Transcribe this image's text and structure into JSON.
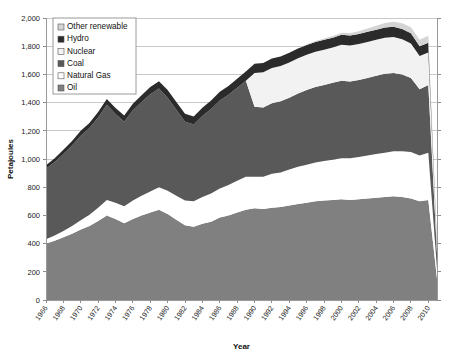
{
  "chart_data": {
    "type": "area",
    "title": "",
    "xlabel": "Year",
    "ylabel": "Petajoules",
    "stacked": true,
    "grid": true,
    "legend_position": "top-left",
    "xlim": [
      1966,
      2011
    ],
    "ylim": [
      0,
      2000
    ],
    "ytick_step": 200,
    "ytick_labels": [
      "0",
      "200",
      "400",
      "600",
      "800",
      "1,000",
      "1,200",
      "1,400",
      "1,600",
      "1,800",
      "2,000"
    ],
    "xtick_labels": [
      "1966",
      "1968",
      "1970",
      "1972",
      "1974",
      "1976",
      "1978",
      "1980",
      "1982",
      "1984",
      "1986",
      "1988",
      "1990",
      "1992",
      "1994",
      "1996",
      "1998",
      "2000",
      "2002",
      "2004",
      "2006",
      "2008",
      "2010"
    ],
    "x": [
      1966,
      1967,
      1968,
      1969,
      1970,
      1971,
      1972,
      1973,
      1974,
      1975,
      1976,
      1977,
      1978,
      1979,
      1980,
      1981,
      1982,
      1983,
      1984,
      1985,
      1986,
      1987,
      1988,
      1989,
      1990,
      1991,
      1992,
      1993,
      1994,
      1995,
      1996,
      1997,
      1998,
      1999,
      2000,
      2001,
      2002,
      2003,
      2004,
      2005,
      2006,
      2007,
      2008,
      2009,
      2010,
      2011
    ],
    "series": [
      {
        "name": "Oil",
        "color": "#808080",
        "values": [
          400,
          420,
          445,
          470,
          500,
          525,
          560,
          600,
          575,
          545,
          575,
          600,
          620,
          640,
          610,
          570,
          530,
          520,
          540,
          555,
          585,
          600,
          620,
          640,
          650,
          645,
          655,
          660,
          670,
          680,
          690,
          700,
          705,
          710,
          715,
          710,
          715,
          720,
          725,
          730,
          735,
          730,
          720,
          700,
          710,
          150
        ]
      },
      {
        "name": "Natural Gas",
        "color": "#ffffff",
        "values": [
          30,
          38,
          45,
          55,
          65,
          80,
          95,
          110,
          115,
          120,
          130,
          140,
          150,
          160,
          165,
          170,
          175,
          180,
          190,
          200,
          205,
          215,
          225,
          235,
          225,
          230,
          240,
          245,
          255,
          265,
          270,
          275,
          280,
          285,
          290,
          295,
          300,
          305,
          310,
          315,
          320,
          325,
          330,
          325,
          335,
          70
        ]
      },
      {
        "name": "Coal",
        "color": "#595959",
        "values": [
          500,
          520,
          545,
          570,
          600,
          615,
          640,
          675,
          630,
          600,
          640,
          665,
          690,
          700,
          660,
          610,
          560,
          545,
          575,
          600,
          625,
          640,
          660,
          680,
          495,
          490,
          500,
          505,
          510,
          520,
          530,
          535,
          540,
          545,
          550,
          545,
          545,
          550,
          555,
          560,
          555,
          545,
          525,
          470,
          480,
          110
        ]
      },
      {
        "name": "Nuclear",
        "color": "#f2f2f2",
        "values": [
          0,
          0,
          0,
          0,
          0,
          0,
          0,
          0,
          0,
          0,
          0,
          0,
          0,
          0,
          0,
          0,
          0,
          0,
          0,
          0,
          0,
          0,
          0,
          0,
          240,
          250,
          250,
          250,
          250,
          250,
          250,
          250,
          250,
          250,
          255,
          255,
          255,
          255,
          255,
          255,
          255,
          250,
          245,
          235,
          230,
          50
        ]
      },
      {
        "name": "Hydro",
        "color": "#2b2b2b",
        "values": [
          25,
          28,
          30,
          32,
          35,
          36,
          38,
          40,
          42,
          44,
          46,
          48,
          50,
          52,
          54,
          55,
          56,
          57,
          58,
          60,
          62,
          63,
          64,
          65,
          66,
          66,
          67,
          67,
          68,
          68,
          69,
          69,
          70,
          70,
          71,
          71,
          71,
          72,
          72,
          72,
          73,
          72,
          71,
          70,
          70,
          18
        ]
      },
      {
        "name": "Other renewable",
        "color": "#d4d4d4",
        "values": [
          0,
          0,
          0,
          0,
          0,
          0,
          0,
          0,
          0,
          0,
          0,
          0,
          0,
          0,
          0,
          0,
          0,
          0,
          0,
          0,
          0,
          0,
          0,
          0,
          0,
          0,
          0,
          0,
          0,
          0,
          5,
          8,
          10,
          12,
          15,
          18,
          20,
          24,
          28,
          32,
          36,
          40,
          44,
          46,
          50,
          12
        ]
      }
    ],
    "legend_order": [
      "Other renewable",
      "Hydro",
      "Nuclear",
      "Coal",
      "Natural Gas",
      "Oil"
    ]
  }
}
